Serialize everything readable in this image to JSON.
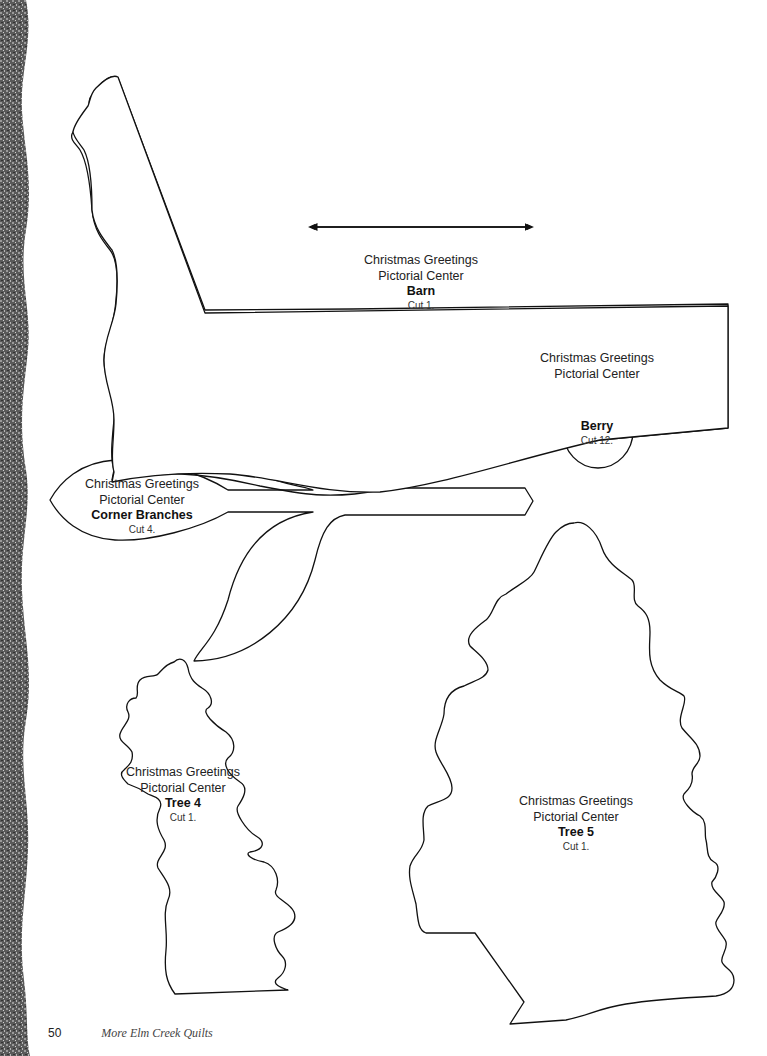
{
  "patterns": {
    "barn": {
      "line1": "Christmas Greetings",
      "line2": "Pictorial Center",
      "name": "Barn",
      "cut": "Cut 1.",
      "has_grainline_arrow": true
    },
    "berry": {
      "line1": "Christmas Greetings",
      "line2": "Pictorial Center",
      "name": "Berry",
      "cut": "Cut 12."
    },
    "corner_branches": {
      "line1": "Christmas Greetings",
      "line2": "Pictorial Center",
      "name": "Corner Branches",
      "cut": "Cut 4."
    },
    "tree4": {
      "line1": "Christmas Greetings",
      "line2": "Pictorial Center",
      "name": "Tree 4",
      "cut": "Cut 1."
    },
    "tree5": {
      "line1": "Christmas Greetings",
      "line2": "Pictorial Center",
      "name": "Tree 5",
      "cut": "Cut 1."
    }
  },
  "footer": {
    "page_number": "50",
    "book_title": "More Elm Creek Quilts"
  }
}
